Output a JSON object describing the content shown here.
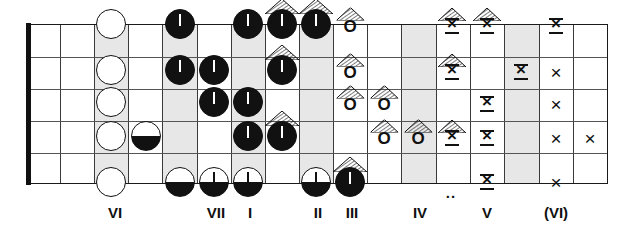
{
  "diagram": {
    "kind": "guitar-fretboard-chart",
    "string_count": 6,
    "fret_count": 16,
    "board": {
      "left": 28,
      "top": 24,
      "width": 580,
      "height": 160
    },
    "colors": {
      "ink": "#111111",
      "fret_line": "#3a3a3a",
      "string_line": "#555555",
      "shaded_fret_fill": "#e7e7e7",
      "paper": "#ffffff"
    },
    "shaded_frets": [
      2,
      4,
      6,
      8,
      11,
      14
    ],
    "fret_edges": [
      28,
      60,
      94,
      128,
      162,
      197,
      231,
      265,
      299,
      333,
      367,
      401,
      436,
      470,
      504,
      539,
      573,
      608
    ],
    "nut": {
      "x": 26,
      "y": 23,
      "width": 5,
      "height": 162
    },
    "string_y": [
      24,
      56,
      88,
      120,
      152,
      184
    ]
  },
  "legend_note": ".. = position dot marker between frets IV and V",
  "position_dot": {
    "text": "..",
    "x": 451,
    "y": 184
  },
  "fret_labels": [
    {
      "text": "VI",
      "x": 115,
      "y": 204
    },
    {
      "text": "VII",
      "x": 216,
      "y": 204
    },
    {
      "text": "I",
      "x": 250,
      "y": 204
    },
    {
      "text": "II",
      "x": 318,
      "y": 204
    },
    {
      "text": "III",
      "x": 352,
      "y": 204
    },
    {
      "text": "IV",
      "x": 420,
      "y": 204
    },
    {
      "text": "V",
      "x": 487,
      "y": 204
    },
    {
      "text": "(VI)",
      "x": 556,
      "y": 204
    }
  ],
  "symbol_types": {
    "open_circle": "white circle, black outline",
    "half_circle": "circle with black lower half",
    "half_circle_stem": "circle with black lower half and vertical stem",
    "full_circle_stem": "solid black circle with white vertical stem",
    "half_circle_stem_roof": "half-filled circle with stem under a hatched roof",
    "letter_o": "letter O",
    "letter_o_roof": "letter O under a hatched roof",
    "bowtie_x": "X with top and bottom bars",
    "bowtie_x_roof": "bowtie X under a hatched roof",
    "plain_x": "plain X"
  },
  "marks": [
    {
      "type": "open_circle",
      "x": 111,
      "y": 24
    },
    {
      "type": "open_circle",
      "x": 111,
      "y": 70
    },
    {
      "type": "open_circle",
      "x": 111,
      "y": 102
    },
    {
      "type": "open_circle",
      "x": 111,
      "y": 136
    },
    {
      "type": "open_circle",
      "x": 111,
      "y": 182
    },
    {
      "type": "half_circle",
      "x": 146,
      "y": 136
    },
    {
      "type": "full_circle_stem",
      "x": 180,
      "y": 24
    },
    {
      "type": "full_circle_stem",
      "x": 180,
      "y": 70
    },
    {
      "type": "half_circle",
      "x": 180,
      "y": 182
    },
    {
      "type": "full_circle_stem",
      "x": 214,
      "y": 70
    },
    {
      "type": "full_circle_stem",
      "x": 214,
      "y": 102
    },
    {
      "type": "half_circle_stem",
      "x": 214,
      "y": 182
    },
    {
      "type": "full_circle_stem",
      "x": 248,
      "y": 24
    },
    {
      "type": "full_circle_stem",
      "x": 248,
      "y": 102
    },
    {
      "type": "full_circle_stem",
      "x": 248,
      "y": 136
    },
    {
      "type": "half_circle_stem",
      "x": 248,
      "y": 182
    },
    {
      "type": "half_circle_stem_roof",
      "x": 282,
      "y": 24
    },
    {
      "type": "half_circle_stem_roof",
      "x": 282,
      "y": 70
    },
    {
      "type": "half_circle_stem_roof",
      "x": 282,
      "y": 136
    },
    {
      "type": "half_circle_stem_roof",
      "x": 316,
      "y": 24
    },
    {
      "type": "half_circle_stem",
      "x": 316,
      "y": 182
    },
    {
      "type": "letter_o_roof",
      "x": 350,
      "y": 26
    },
    {
      "type": "letter_o_roof",
      "x": 350,
      "y": 72
    },
    {
      "type": "letter_o_roof",
      "x": 350,
      "y": 104
    },
    {
      "type": "half_circle_stem_roof",
      "x": 350,
      "y": 182
    },
    {
      "type": "letter_o_roof",
      "x": 384,
      "y": 104
    },
    {
      "type": "letter_o_roof",
      "x": 384,
      "y": 138
    },
    {
      "type": "letter_o_roof",
      "x": 418,
      "y": 138
    },
    {
      "type": "bowtie_x_roof",
      "x": 452,
      "y": 26
    },
    {
      "type": "bowtie_x_roof",
      "x": 452,
      "y": 72
    },
    {
      "type": "bowtie_x_roof",
      "x": 452,
      "y": 138
    },
    {
      "type": "bowtie_x_roof",
      "x": 487,
      "y": 26
    },
    {
      "type": "bowtie_x",
      "x": 487,
      "y": 104
    },
    {
      "type": "bowtie_x",
      "x": 487,
      "y": 138
    },
    {
      "type": "bowtie_x",
      "x": 487,
      "y": 182
    },
    {
      "type": "bowtie_x",
      "x": 521,
      "y": 72
    },
    {
      "type": "bowtie_x",
      "x": 556,
      "y": 26
    },
    {
      "type": "plain_x",
      "x": 556,
      "y": 72
    },
    {
      "type": "plain_x",
      "x": 556,
      "y": 104
    },
    {
      "type": "plain_x",
      "x": 556,
      "y": 138
    },
    {
      "type": "plain_x",
      "x": 556,
      "y": 182
    },
    {
      "type": "plain_x",
      "x": 590,
      "y": 138
    }
  ]
}
